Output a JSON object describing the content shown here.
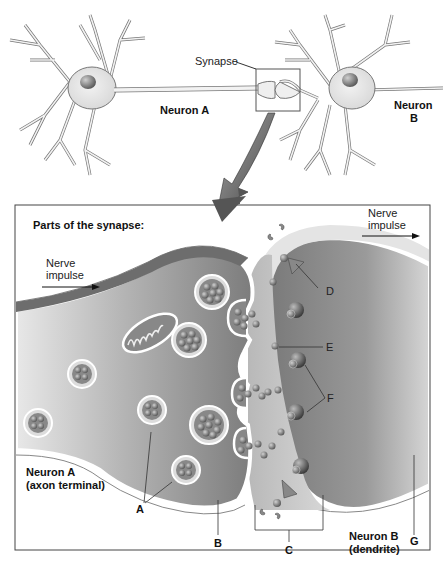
{
  "overview": {
    "synapse_label": "Synapse",
    "neuron_a_label": "Neuron A",
    "neuron_b_label_line1": "Neuron",
    "neuron_b_label_line2": "B"
  },
  "detail": {
    "title": "Parts of the synapse:",
    "impulse_left_line1": "Nerve",
    "impulse_left_line2": "impulse",
    "impulse_right_line1": "Nerve",
    "impulse_right_line2": "impulse",
    "neuron_a_line1": "Neuron A",
    "neuron_a_line2": "(axon terminal)",
    "neuron_b_line1": "Neuron B",
    "neuron_b_line2": "(dendrite)",
    "parts": {
      "A": "A",
      "B": "B",
      "C": "C",
      "D": "D",
      "E": "E",
      "F": "F",
      "G": "G"
    }
  },
  "colors": {
    "cell_fill": "#ececec",
    "cell_stroke": "#555555",
    "axon_dark": "#7a7a7a",
    "dendrite_dark": "#8a8a8a",
    "vesicle": "#6e6e6e",
    "frame": "#444444"
  }
}
